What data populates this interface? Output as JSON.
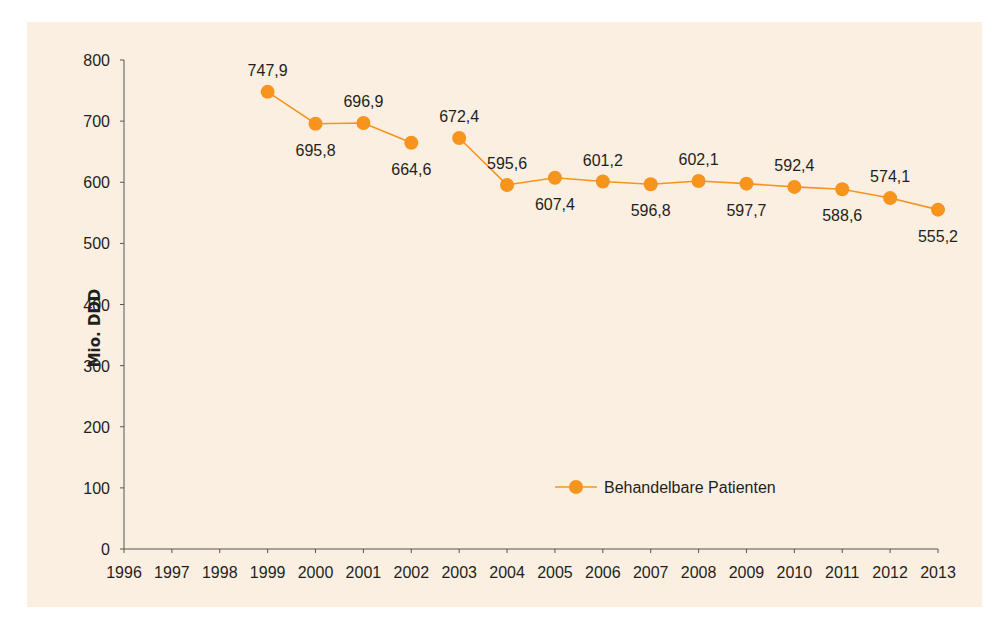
{
  "chart_data": {
    "type": "line",
    "title": "",
    "xlabel": "",
    "ylabel": "Mio. DDD",
    "ylim": [
      0,
      800
    ],
    "yticks": [
      0,
      100,
      200,
      300,
      400,
      500,
      600,
      700,
      800
    ],
    "x": [
      1996,
      1997,
      1998,
      1999,
      2000,
      2001,
      2002,
      2003,
      2004,
      2005,
      2006,
      2007,
      2008,
      2009,
      2010,
      2011,
      2012,
      2013
    ],
    "grid": false,
    "legend_position": "inside-lower-right",
    "series": [
      {
        "name": "Behandelbare Patienten",
        "color": "#f7941d",
        "points": [
          {
            "x": 1999,
            "y": 747.9,
            "label": "747,9",
            "label_pos": "above"
          },
          {
            "x": 2000,
            "y": 695.8,
            "label": "695,8",
            "label_pos": "below"
          },
          {
            "x": 2001,
            "y": 696.9,
            "label": "696,9",
            "label_pos": "above"
          },
          {
            "x": 2002,
            "y": 664.6,
            "label": "664,6",
            "label_pos": "below"
          },
          {
            "x": 2003,
            "y": 672.4,
            "label": "672,4",
            "label_pos": "above"
          },
          {
            "x": 2004,
            "y": 595.6,
            "label": "595,6",
            "label_pos": "above"
          },
          {
            "x": 2005,
            "y": 607.4,
            "label": "607,4",
            "label_pos": "below"
          },
          {
            "x": 2006,
            "y": 601.2,
            "label": "601,2",
            "label_pos": "above"
          },
          {
            "x": 2007,
            "y": 596.8,
            "label": "596,8",
            "label_pos": "below"
          },
          {
            "x": 2008,
            "y": 602.1,
            "label": "602,1",
            "label_pos": "above"
          },
          {
            "x": 2009,
            "y": 597.7,
            "label": "597,7",
            "label_pos": "below"
          },
          {
            "x": 2010,
            "y": 592.4,
            "label": "592,4",
            "label_pos": "above"
          },
          {
            "x": 2011,
            "y": 588.6,
            "label": "588,6",
            "label_pos": "below"
          },
          {
            "x": 2012,
            "y": 574.1,
            "label": "574,1",
            "label_pos": "above"
          },
          {
            "x": 2013,
            "y": 555.2,
            "label": "555,2",
            "label_pos": "below"
          }
        ],
        "segments": [
          [
            1999,
            2002
          ],
          [
            2003,
            2013
          ]
        ]
      }
    ]
  },
  "legend": {
    "label": "Behandelbare Patienten"
  },
  "axis": {
    "ylabel": "Mio. DDD"
  },
  "colors": {
    "background": "#fbefe2",
    "series": "#f7941d",
    "axis": "#555555",
    "text": "#231f20"
  }
}
